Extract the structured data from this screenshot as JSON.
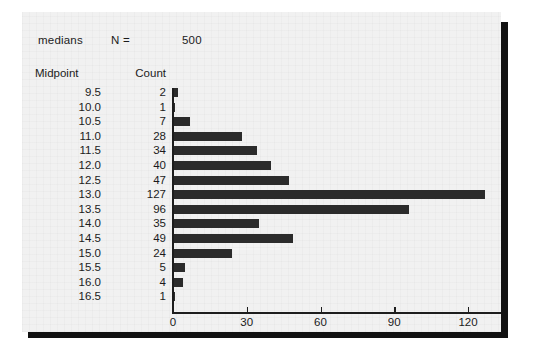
{
  "figure": {
    "header": {
      "label": "medians",
      "n_label": "N =",
      "n_value": "500"
    },
    "columns": {
      "midpoint": "Midpoint",
      "count": "Count"
    }
  },
  "chart_data": {
    "type": "bar",
    "orientation": "horizontal",
    "title": "medians",
    "xlabel": "",
    "ylabel": "Midpoint",
    "grid": false,
    "legend": null,
    "xlim": [
      0,
      133
    ],
    "xticks": [
      0,
      30,
      60,
      90,
      120
    ],
    "xtick_labels": [
      "0",
      "30",
      "60",
      "90",
      "120"
    ],
    "n": 500,
    "categories": [
      "9.5",
      "10.0",
      "10.5",
      "11.0",
      "11.5",
      "12.0",
      "12.5",
      "13.0",
      "13.5",
      "14.0",
      "14.5",
      "15.0",
      "15.5",
      "16.0",
      "16.5"
    ],
    "values": [
      2,
      1,
      7,
      28,
      34,
      40,
      47,
      127,
      96,
      35,
      49,
      24,
      5,
      4,
      1
    ],
    "value_labels": [
      "2",
      "1",
      "7",
      "28",
      "34",
      "40",
      "47",
      "127",
      "96",
      "35",
      "49",
      "24",
      "5",
      "4",
      "1"
    ],
    "colors": {
      "bar": "#2b2b2b",
      "axis": "#1d1d1d",
      "paper": "#f1f1f1",
      "text": "#1b1b1b",
      "shadow": "#111111"
    }
  }
}
